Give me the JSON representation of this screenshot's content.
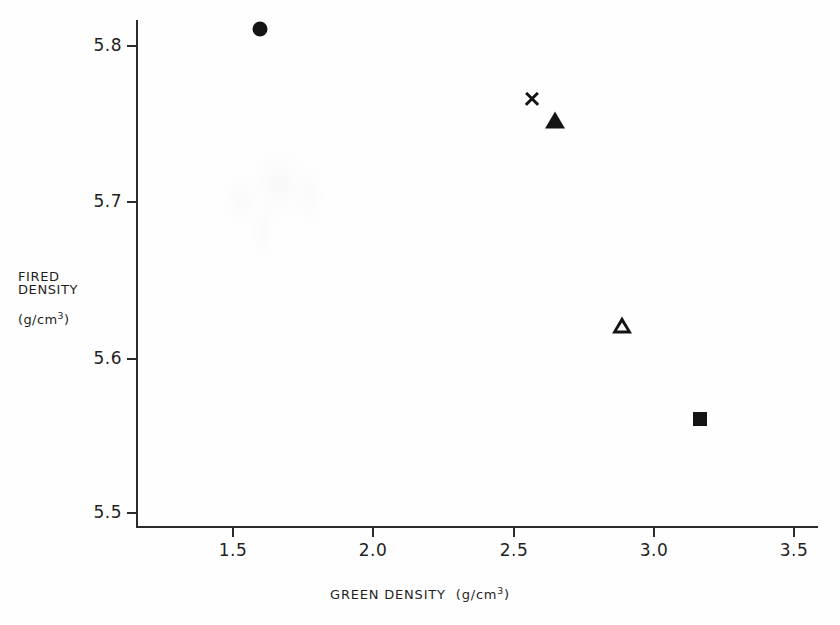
{
  "chart_data": {
    "type": "scatter",
    "title": "",
    "xlabel": "GREEN DENSITY  (g/cm3)",
    "ylabel": "FIRED DENSITY (g/cm3)",
    "xlim": [
      1.3,
      3.6
    ],
    "ylim": [
      5.47,
      5.83
    ],
    "grid": false,
    "legend": "none",
    "xticks": [
      "1.5",
      "2.0",
      "2.5",
      "3.0",
      "3.5"
    ],
    "xtick_values": [
      1.5,
      2.0,
      2.5,
      3.0,
      3.5
    ],
    "yticks": [
      "5.8",
      "5.7",
      "5.6",
      "5.5"
    ],
    "ytick_values": [
      5.8,
      5.7,
      5.6,
      5.5
    ],
    "points": [
      {
        "marker": "filled-circle",
        "x": 1.6,
        "y": 5.81
      },
      {
        "marker": "cross",
        "x": 2.57,
        "y": 5.765
      },
      {
        "marker": "filled-triangle",
        "x": 2.65,
        "y": 5.752
      },
      {
        "marker": "open-triangle",
        "x": 2.89,
        "y": 5.62
      },
      {
        "marker": "filled-square",
        "x": 3.17,
        "y": 5.56
      }
    ]
  },
  "axes": {
    "y_title_line1": "FIRED",
    "y_title_line2": "DENSITY",
    "y_title_unit_open": "(g/cm",
    "y_title_unit_exp": "3",
    "y_title_unit_close": ")",
    "x_title_main": "GREEN DENSITY",
    "x_title_unit_open": "(g/cm",
    "x_title_unit_exp": "3",
    "x_title_unit_close": ")"
  },
  "style": {
    "axis_color": "#2b2b2b",
    "marker_color": "#141414",
    "background": "#fefefe",
    "text_color": "#1f1f1f"
  }
}
